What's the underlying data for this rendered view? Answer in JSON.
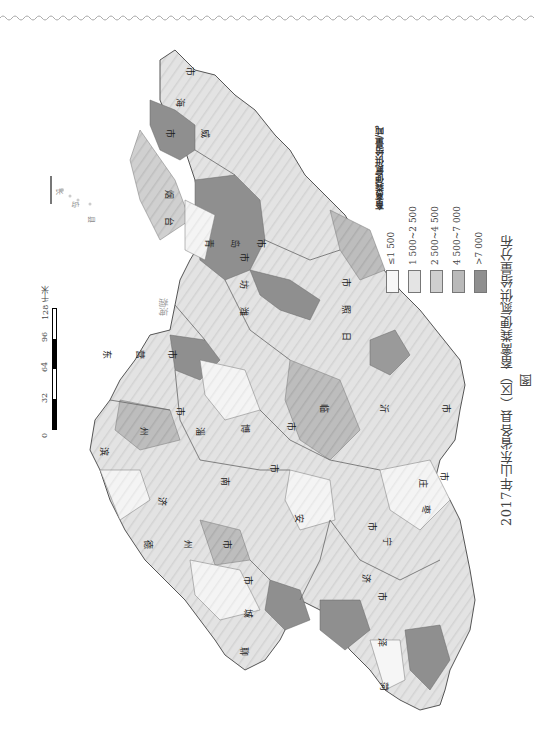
{
  "title": "2017年山东省各县（区）畜禽粪便氮供给量分布图",
  "legend": {
    "title": "畜禽粪便氮供给量/吨",
    "items": [
      {
        "label": "≤1 500",
        "color": "#f7f7f7"
      },
      {
        "label": "1 500~2 500",
        "color": "#e4e4e4"
      },
      {
        "label": "2 500~4 500",
        "color": "#cfcfcf"
      },
      {
        "label": "4 500~7 000",
        "color": "#b9b9b9"
      },
      {
        "label": ">7 000",
        "color": "#8f8f8f"
      }
    ]
  },
  "scale_bar": {
    "ticks": [
      "0",
      "32",
      "64",
      "96",
      "128 千米"
    ]
  },
  "sea_labels": [
    "渤海",
    "黄海"
  ],
  "island_labels": [
    "长",
    "岛",
    "县"
  ],
  "city_labels": [
    {
      "name": "威海市",
      "chars": [
        "市",
        "海",
        "市",
        "威"
      ]
    },
    {
      "name": "烟台市",
      "chars": [
        "烟",
        "台",
        "市"
      ]
    },
    {
      "name": "青岛市",
      "chars": [
        "青",
        "岛",
        "市"
      ]
    },
    {
      "name": "潍坊市",
      "chars": [
        "潍",
        "坊",
        "市"
      ]
    },
    {
      "name": "日照市",
      "chars": [
        "日",
        "照",
        "市"
      ]
    },
    {
      "name": "临沂市",
      "chars": [
        "临",
        "沂",
        "市"
      ]
    },
    {
      "name": "东营市",
      "chars": [
        "东",
        "营",
        "市"
      ]
    },
    {
      "name": "淄博市",
      "chars": [
        "淄",
        "博",
        "市"
      ]
    },
    {
      "name": "滨州市",
      "chars": [
        "滨",
        "州",
        "市"
      ]
    },
    {
      "name": "济南市",
      "chars": [
        "济",
        "南",
        "市"
      ]
    },
    {
      "name": "莱芜市",
      "chars": [
        "莱",
        "芜",
        "市"
      ]
    },
    {
      "name": "泰安市",
      "chars": [
        "泰",
        "安",
        "市"
      ]
    },
    {
      "name": "枣庄市",
      "chars": [
        "枣",
        "庄",
        "市"
      ]
    },
    {
      "name": "济宁市",
      "chars": [
        "济",
        "宁",
        "市"
      ]
    },
    {
      "name": "德州市",
      "chars": [
        "德",
        "州",
        "市"
      ]
    },
    {
      "name": "聊城市",
      "chars": [
        "聊",
        "城",
        "市"
      ]
    },
    {
      "name": "菏泽市",
      "chars": [
        "菏",
        "泽",
        "市"
      ]
    }
  ]
}
